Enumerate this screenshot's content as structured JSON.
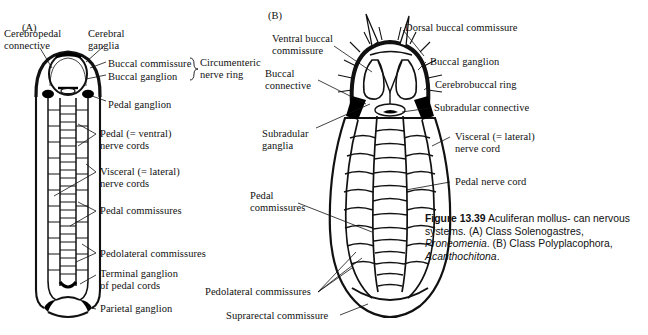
{
  "figure": {
    "panel_a_letter": "(A)",
    "panel_b_letter": "(B)",
    "caption": {
      "figure_number": "Figure 13.39",
      "title": "Aculiferan molluscan nervous systems.",
      "panel_a_text": "(A) Class Solenogastres,",
      "panel_a_genus": "Proneomenia",
      "panel_b_text": "(B) Class Polyplacophora,",
      "panel_b_genus": "Acanthochitona",
      "line1_bold": "Figure 13.39",
      "line1_rest": "Aculiferan mollus-",
      "line2": "can nervous systems. (A) Class",
      "line3_plain": "Solenogastres, ",
      "line3_italic": "Proneomenia",
      "line3_end": ".",
      "line4": "(B) Class Polyplacophora,",
      "line5_italic": "Acanthochitona",
      "line5_end": "."
    }
  },
  "panel_a": {
    "labels": [
      {
        "id": "cerebropedal-connective",
        "text": "Cerebropedal\nconnective",
        "x": 4,
        "y": 28
      },
      {
        "id": "cerebral-ganglia",
        "text": "Cerebral\nganglia",
        "x": 88,
        "y": 28
      },
      {
        "id": "buccal-commissure",
        "text": "Buccal commissure",
        "x": 108,
        "y": 58
      },
      {
        "id": "buccal-ganglion",
        "text": "Buccal ganglion",
        "x": 108,
        "y": 71
      },
      {
        "id": "circumenteric-nerve-ring",
        "text": "Circumenteric\nnerve ring",
        "x": 196,
        "y": 57
      },
      {
        "id": "pedal-ganglion",
        "text": "Pedal ganglion",
        "x": 108,
        "y": 99
      },
      {
        "id": "pedal-nerve-cords",
        "text": "Pedal (= ventral)\nnerve cords",
        "x": 98,
        "y": 128
      },
      {
        "id": "visceral-nerve-cords",
        "text": "Visceral (= lateral)\nnerve cords",
        "x": 98,
        "y": 168
      },
      {
        "id": "pedal-commissures",
        "text": "Pedal commissures",
        "x": 98,
        "y": 205
      },
      {
        "id": "pedolateral-commissures",
        "text": "Pedolateral commissures",
        "x": 98,
        "y": 249
      },
      {
        "id": "terminal-ganglion-pedal-cords",
        "text": "Terminal ganglion\nof pedal cords",
        "x": 98,
        "y": 269
      },
      {
        "id": "parietal-ganglion",
        "text": "Parietal ganglion",
        "x": 98,
        "y": 305
      }
    ]
  },
  "panel_b": {
    "labels": [
      {
        "id": "ventral-buccal-commissure",
        "text": "Ventral buccal\ncommissure",
        "x": 272,
        "y": 33
      },
      {
        "id": "dorsal-buccal-commissure",
        "text": "Dorsal buccal commissure",
        "x": 405,
        "y": 23
      },
      {
        "id": "buccal-ganglion-b",
        "text": "Buccal ganglion",
        "x": 428,
        "y": 58
      },
      {
        "id": "buccal-connective",
        "text": "Buccal\nconnective",
        "x": 265,
        "y": 67
      },
      {
        "id": "cerebrobuccal-ring",
        "text": "Cerebrobuccal ring",
        "x": 432,
        "y": 81
      },
      {
        "id": "subradular-connective",
        "text": "Subradular connective",
        "x": 432,
        "y": 104
      },
      {
        "id": "subradular-ganglia",
        "text": "Subradular\nganglia",
        "x": 262,
        "y": 130
      },
      {
        "id": "visceral-lateral-nerve-cord",
        "text": "Visceral (= lateral)\nnerve cord",
        "x": 452,
        "y": 133
      },
      {
        "id": "pedal-nerve-cord",
        "text": "Pedal nerve cord",
        "x": 452,
        "y": 178
      },
      {
        "id": "pedal-commissures-b",
        "text": "Pedal\ncommissures",
        "x": 250,
        "y": 192
      },
      {
        "id": "pedolateral-commissures-b",
        "text": "Pedolateral commissures",
        "x": 207,
        "y": 288
      },
      {
        "id": "suprarectal-commissure",
        "text": "Suprarectal commissure",
        "x": 228,
        "y": 312
      }
    ]
  },
  "colors": {
    "ink": "#111111",
    "background": "#ffffff",
    "fill": "#ffffff",
    "ganglion": "#000000"
  }
}
